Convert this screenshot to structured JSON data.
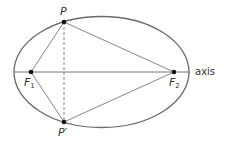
{
  "diagram": {
    "type": "ellipse-foci",
    "colors": {
      "ellipse": "#6a6a6a",
      "lines": "#777777",
      "points": "#111111",
      "text": "#333333"
    },
    "ellipse": {
      "cx": 101.5,
      "cy": 72,
      "rx": 87.5,
      "ry": 55.5
    },
    "axis": {
      "x1": 14,
      "x2": 190,
      "y": 72,
      "label": "axis"
    },
    "points": {
      "P": {
        "x": 64,
        "y": 22,
        "label": "P"
      },
      "P_prime": {
        "x": 64,
        "y": 122,
        "label": "P′"
      },
      "F1": {
        "x": 31,
        "y": 72,
        "label": "F",
        "sub": "1"
      },
      "F2": {
        "x": 174,
        "y": 72,
        "label": "F",
        "sub": "2"
      }
    },
    "chord": {
      "from": "P",
      "to": "P_prime",
      "style": "dashed"
    }
  }
}
